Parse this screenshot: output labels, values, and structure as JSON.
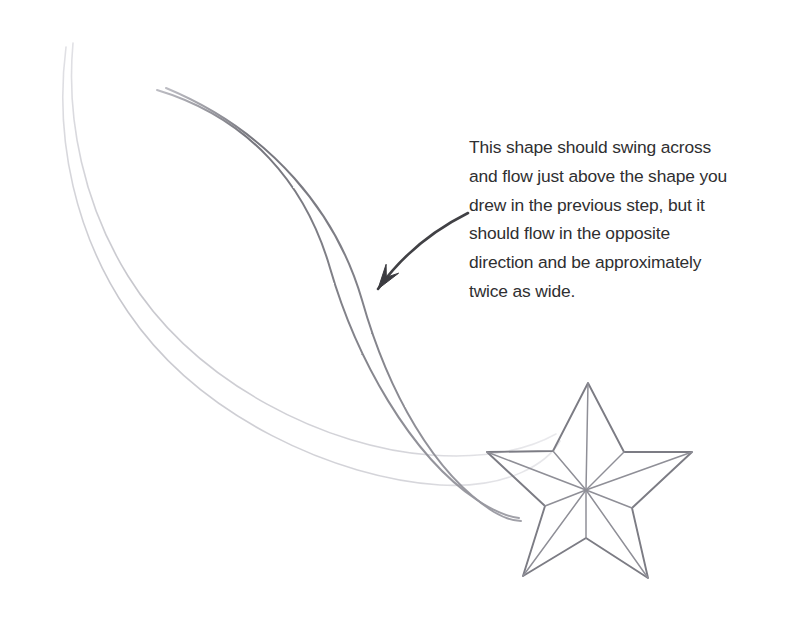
{
  "page": {
    "width": 794,
    "height": 624,
    "background_color": "#ffffff",
    "kind": "pencil-drawing-instruction"
  },
  "annotation": {
    "text": "This shape should swing across and flow just above the shape you drew in the previous step, but it should flow in the opposite direction and be approximately twice as wide.",
    "lines": [
      "This shape should swing across",
      "and flow just above the shape you",
      "drew in the previous step, but it",
      "should flow in the opposite",
      "direction and be approximately",
      "twice as wide."
    ],
    "text_color": "#2f2f31",
    "font_size_px": 17.4,
    "line_height_px": 28.8,
    "left_px": 469,
    "top_px": 133
  },
  "pointer": {
    "name": "curved-arrow",
    "color": "#414145",
    "stroke_width": 2.6,
    "start": [
      468,
      213
    ],
    "end": [
      378,
      289
    ],
    "control1": [
      430,
      232
    ],
    "control2": [
      400,
      258
    ],
    "arrowhead_length_px": 26
  },
  "drawing": {
    "title": "shooting star with two ribbon trails",
    "strokes": [
      {
        "name": "new-ribbon-upper-edge",
        "role": "new-shape",
        "tone": "dark",
        "color": "#8d8d93",
        "stroke_width": 2.0,
        "opacity": 0.95,
        "path": "M 157 90 C 250 118 306 185 330 268 C 356 358 410 455 477 500 C 497 513 510 517 519 518"
      },
      {
        "name": "new-ribbon-lower-edge",
        "role": "new-shape",
        "tone": "dark",
        "color": "#8d8d93",
        "stroke_width": 2.0,
        "opacity": 0.95,
        "path": "M 166 88 C 272 132 337 214 362 300 C 388 392 434 474 494 512 C 506 519 514 521 521 521"
      },
      {
        "name": "previous-ribbon-upper-edge",
        "role": "previous-shape",
        "tone": "light",
        "color": "#c6c6cc",
        "stroke_width": 1.6,
        "opacity": 0.85,
        "path": "M 73 43 C 66 120 84 205 128 276 C 196 386 330 448 430 455 C 500 460 538 444 556 434"
      },
      {
        "name": "previous-ribbon-lower-edge",
        "role": "previous-shape",
        "tone": "light",
        "color": "#c6c6cc",
        "stroke_width": 1.6,
        "opacity": 0.85,
        "path": "M 66 47 C 54 140 76 236 128 312 C 200 418 336 478 440 485 C 510 489 548 462 560 441"
      }
    ],
    "star": {
      "name": "five-pointed-star",
      "outline_color": "#7c7c84",
      "facet_color": "#8f8f97",
      "stroke_width": 1.9,
      "facet_stroke_width": 1.5,
      "center": [
        586,
        490
      ],
      "outer_points": [
        [
          588,
          383
        ],
        [
          692,
          452
        ],
        [
          648,
          578
        ],
        [
          523,
          576
        ],
        [
          487,
          452
        ]
      ],
      "inner_points": [
        [
          624,
          452
        ],
        [
          632,
          508
        ],
        [
          586,
          538
        ],
        [
          545,
          506
        ],
        [
          553,
          451
        ]
      ]
    }
  }
}
